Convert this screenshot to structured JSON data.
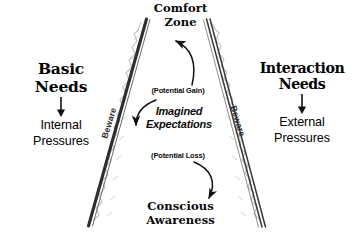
{
  "diagram": {
    "background_color": "#ffffff",
    "ink_color": "#0a0a0a",
    "wall_color": "#3a3a3a"
  },
  "top": {
    "label": "Comfort\nZone"
  },
  "bottom": {
    "label": "Conscious\nAwareness"
  },
  "left": {
    "heading": "Basic\nNeeds",
    "arrow_icon": "down-arrow-icon",
    "subtitle": "Internal\nPressures"
  },
  "right": {
    "heading": "Interaction\nNeeds",
    "arrow_icon": "down-arrow-icon",
    "subtitle": "External\nPressures"
  },
  "center": {
    "potential_gain": "(Potential Gain)",
    "imagined_expectations": "Imagined\nExpectations",
    "potential_loss": "(Potential Loss)"
  },
  "walls": {
    "left_label": "Beware",
    "right_label": "Beware"
  },
  "arrows": {
    "gain_arrow": "curved-up-arrow-icon",
    "expectation_arrow": "curved-left-arrow-icon",
    "loss_arrow": "curved-down-right-arrow-icon"
  }
}
